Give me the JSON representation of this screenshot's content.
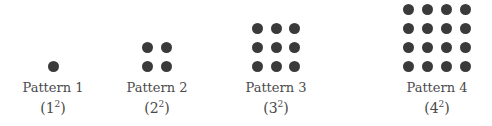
{
  "patterns": [
    {
      "label": "Pattern 1",
      "base": "1",
      "exponent": "2",
      "size": 1,
      "center_x": 53
    },
    {
      "label": "Pattern 2",
      "base": "2",
      "exponent": "2",
      "size": 2,
      "center_x": 157
    },
    {
      "label": "Pattern 3",
      "base": "3",
      "exponent": "2",
      "size": 3,
      "center_x": 276
    },
    {
      "label": "Pattern 4",
      "base": "4",
      "exponent": "2",
      "size": 4,
      "center_x": 437
    }
  ],
  "colors": {
    "dot": "#3a3a3a",
    "text": "#4a4a4a",
    "background": "#ffffff"
  }
}
